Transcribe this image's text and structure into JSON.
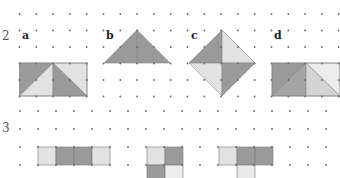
{
  "exercises": [
    {
      "number": "2",
      "parts": [
        {
          "label": "a",
          "description": "3x2 rectangle split into four right triangles, alternating dark and light grey"
        },
        {
          "label": "b",
          "description": "isosceles triangle with apex above center, dark grey with center vertical line"
        },
        {
          "label": "c",
          "description": "diamond (square rotated 45°) split into four triangles: dark top-left, light top-right, light bottom-left, dark bottom-right"
        },
        {
          "label": "d",
          "description": "rectangle: dark square on left split diagonally, light trapezoid on right with lighter triangle"
        }
      ]
    },
    {
      "number": "3",
      "parts": [
        {
          "description": "row of four squares: light, dark, dark, light"
        },
        {
          "description": "2x2 square block: light, dark / dark, light (partially visible)"
        },
        {
          "description": "T-shape: light, dark, dark on top row, light below middle (partially visible)"
        }
      ]
    }
  ],
  "colors": {
    "dark": "#9a9a9a",
    "light": "#e2e2e2",
    "dot": "#666666",
    "edge": "#777777"
  }
}
